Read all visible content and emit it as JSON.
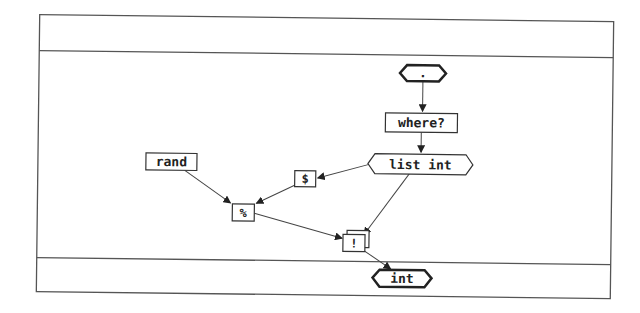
{
  "diagram": {
    "panels": [
      {
        "id": "header-panel",
        "label": ""
      },
      {
        "id": "body-panel",
        "label": ""
      },
      {
        "id": "output-panel",
        "label": ""
      }
    ],
    "nodes": [
      {
        "id": "input",
        "shape": "hexagon-bold",
        "label": "."
      },
      {
        "id": "where",
        "shape": "box",
        "label": "where?"
      },
      {
        "id": "list_int",
        "shape": "hexagon",
        "label": "list int"
      },
      {
        "id": "rand",
        "shape": "box",
        "label": "rand"
      },
      {
        "id": "dollar",
        "shape": "box",
        "label": "$"
      },
      {
        "id": "percent",
        "shape": "box",
        "label": "%"
      },
      {
        "id": "bang",
        "shape": "stacked-box",
        "label": "!"
      },
      {
        "id": "output",
        "shape": "hexagon-bold",
        "label": "int"
      }
    ],
    "edges": [
      {
        "from": "input",
        "to": "where"
      },
      {
        "from": "where",
        "to": "list_int"
      },
      {
        "from": "list_int",
        "to": "dollar"
      },
      {
        "from": "list_int",
        "to": "bang"
      },
      {
        "from": "rand",
        "to": "percent"
      },
      {
        "from": "dollar",
        "to": "percent"
      },
      {
        "from": "percent",
        "to": "bang"
      },
      {
        "from": "bang",
        "to": "output"
      }
    ],
    "colors": {
      "line": "#444444",
      "background": "#ffffff",
      "text": "#222222"
    }
  }
}
